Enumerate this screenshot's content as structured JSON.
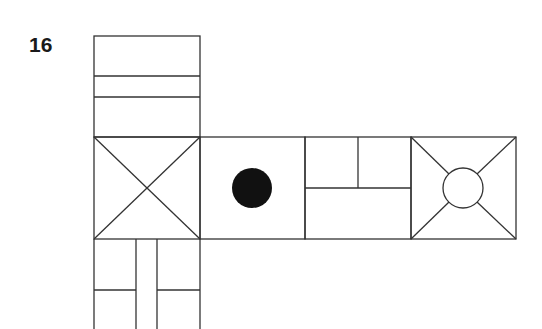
{
  "puzzle": {
    "number": "16",
    "type": "cube net"
  },
  "stroke_color": "#333333",
  "fill_color": "#111111",
  "faces": [
    {
      "name": "top-face",
      "pattern": "two horizontal stripes"
    },
    {
      "name": "left-face",
      "pattern": "diagonal X cross"
    },
    {
      "name": "center-face",
      "pattern": "solid black dot"
    },
    {
      "name": "third-face",
      "pattern": "rectangles split"
    },
    {
      "name": "right-face",
      "pattern": "circle with diagonals"
    },
    {
      "name": "bottom-face",
      "pattern": "vertical strip with two halves"
    }
  ]
}
